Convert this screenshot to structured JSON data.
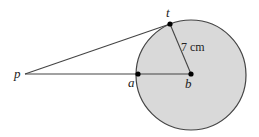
{
  "diagram": {
    "type": "geometry-circle-tangent",
    "colors": {
      "circle_fill": "#d9d9d9",
      "stroke": "#444444",
      "point": "#000000",
      "background": "#ffffff"
    },
    "circle": {
      "center": "b",
      "cx": 191,
      "cy": 75,
      "r": 55
    },
    "points": [
      {
        "id": "p",
        "label": "p",
        "x": 25,
        "y": 74
      },
      {
        "id": "a",
        "label": "a",
        "x": 138,
        "y": 74
      },
      {
        "id": "b",
        "label": "b",
        "x": 191,
        "y": 74
      },
      {
        "id": "t",
        "label": "t",
        "x": 170,
        "y": 24
      }
    ],
    "segments": [
      {
        "from": "p",
        "to": "t",
        "kind": "tangent"
      },
      {
        "from": "p",
        "to": "b",
        "kind": "secant-through-a"
      },
      {
        "from": "t",
        "to": "b",
        "kind": "radius"
      }
    ],
    "radius_label": "7 cm"
  }
}
